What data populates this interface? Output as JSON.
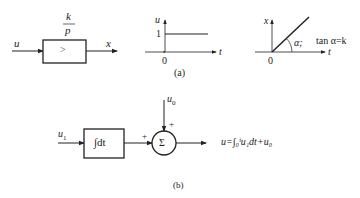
{
  "part_a": {
    "block": {
      "numerator": "k",
      "denominator": "p",
      "symbol": ">",
      "input": "u",
      "output": "x"
    },
    "step_plot": {
      "y_axis": "u",
      "x_axis": "t",
      "level": "1",
      "origin": "0"
    },
    "ramp_plot": {
      "y_axis": "x",
      "x_axis": "t",
      "angle": "α;",
      "origin": "0",
      "relation": "tan α=k"
    },
    "caption": "(a)"
  },
  "part_b": {
    "input": "u",
    "input_sub": "1",
    "integrator": "∫dt",
    "sum_symbol": "Σ",
    "plus_left": "+",
    "plus_top": "+",
    "top_input": "u",
    "top_input_sub": "0",
    "equation": "u=∫₀ᵗu₁dt+u₀",
    "caption": "(b)"
  }
}
